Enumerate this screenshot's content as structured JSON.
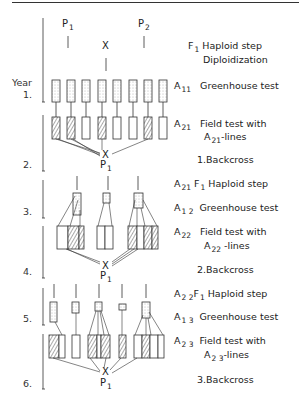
{
  "figure": {
    "parents": [
      {
        "label": "P",
        "sub": "1"
      },
      {
        "label": "P",
        "sub": "2"
      }
    ],
    "cross_symbol": "X",
    "backcross_parent": {
      "label": "P",
      "sub": "1"
    },
    "year_label": "Year",
    "years": [
      "1.",
      "2.",
      "3.",
      "4.",
      "5.",
      "6."
    ],
    "stages": [
      {
        "symbol": "F",
        "symbol_sub": "1",
        "line1": "Haploid step",
        "line2": "Diploidization"
      },
      {
        "symbol": "A",
        "symbol_sub": "11",
        "line1": "Greenhouse test"
      },
      {
        "symbol": "A",
        "symbol_sub": "21",
        "line1": "Field test with",
        "line2_prefix": "A",
        "line2_sub": "21",
        "line2_suffix": "-lines"
      },
      {
        "label": "1.Backcross"
      },
      {
        "symbol": "A",
        "symbol_sub": "21",
        "symbol2": "F",
        "symbol2_sub": "1",
        "line1": "Haploid step"
      },
      {
        "symbol": "A",
        "symbol_sub": "1 2",
        "line1": "Greenhouse test"
      },
      {
        "symbol": "A",
        "symbol_sub": "22",
        "line1": "Field test with",
        "line2_prefix": "A",
        "line2_sub": "22",
        "line2_suffix": " -lines"
      },
      {
        "label": "2.Backcross"
      },
      {
        "symbol": "A",
        "symbol_sub": "2 2",
        "symbol2": "F",
        "symbol2_sub": "1",
        "line1": "Haploid step"
      },
      {
        "symbol": "A",
        "symbol_sub": "1 3",
        "line1": "Greenhouse test"
      },
      {
        "symbol": "A",
        "symbol_sub": "2 3",
        "line1": "Field test with",
        "line2_prefix": "A",
        "line2_sub": "2 3",
        "line2_suffix": "-lines"
      },
      {
        "label": "3.Backcross"
      }
    ],
    "colors": {
      "line": "#333333",
      "fill_dotted": "#e8e8e8",
      "hatch": "#444444"
    }
  }
}
